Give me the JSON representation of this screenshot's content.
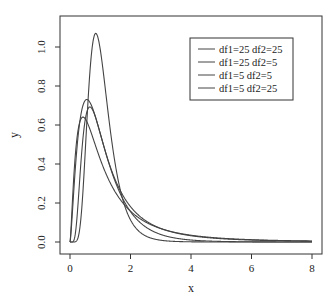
{
  "chart_data": {
    "type": "line",
    "title": "",
    "xlabel": "x",
    "ylabel": "y",
    "xlim": [
      0,
      8
    ],
    "ylim": [
      0,
      1.05
    ],
    "x_ticks": [
      0,
      2,
      4,
      6,
      8
    ],
    "y_ticks": [
      0.0,
      0.2,
      0.4,
      0.6,
      0.8,
      1.0
    ],
    "y_tick_labels": [
      "0.0",
      "0.2",
      "0.4",
      "0.6",
      "0.8",
      "1.0"
    ],
    "grid": false,
    "legend_position": "top-right",
    "series": [
      {
        "name": "df1=25 df2=25",
        "df1": 25,
        "df2": 25,
        "color": "#444444",
        "peak_x": 0.85,
        "peak_y": 1.06
      },
      {
        "name": "df1=25 df2=5",
        "df1": 25,
        "df2": 5,
        "color": "#444444",
        "peak_x": 0.6,
        "peak_y": 0.69
      },
      {
        "name": "df1=5 df2=5",
        "df1": 5,
        "df2": 5,
        "color": "#444444",
        "peak_x": 0.5,
        "peak_y": 0.63
      },
      {
        "name": "df1=5 df2=25",
        "df1": 5,
        "df2": 25,
        "color": "#444444",
        "peak_x": 0.5,
        "peak_y": 0.72
      }
    ]
  },
  "legend": {
    "items": [
      "df1=25 df2=25",
      "df1=25 df2=5",
      "df1=5 df2=5",
      "df1=5 df2=25"
    ]
  }
}
